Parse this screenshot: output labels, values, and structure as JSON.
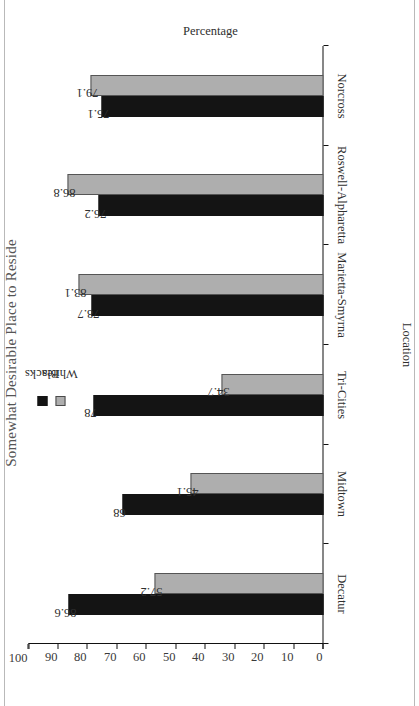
{
  "chart_data": {
    "type": "bar",
    "title": "Somewhat Desirable Place to Reside",
    "categories": [
      "Decatur",
      "Midtown",
      "Tri-Cities",
      "Marietta-Smyrna",
      "Roswell-Alpharetta",
      "Norcross"
    ],
    "series": [
      {
        "name": "Blacks",
        "color": "#141414",
        "values": [
          86.6,
          68,
          78,
          78.7,
          76.2,
          75.1
        ]
      },
      {
        "name": "Whites",
        "color": "#aeaeae",
        "values": [
          57.2,
          45.1,
          34.7,
          83.1,
          86.8,
          79.1
        ]
      }
    ],
    "xlabel": "Location",
    "ylabel": "Percentage",
    "ylim": [
      0,
      100
    ],
    "yticks": [
      0,
      10,
      20,
      30,
      40,
      50,
      60,
      70,
      80,
      90,
      100
    ],
    "ytick_labels": [
      "0",
      "10",
      "20",
      "30",
      "40",
      "50",
      "60",
      "70",
      "80",
      "90",
      "100"
    ],
    "grid": false,
    "legend_position": "top-left",
    "orientation": "rotated-90-ccw",
    "data_labels": [
      "86.6",
      "57.2",
      "68",
      "45.1",
      "78",
      "34.7",
      "78.7",
      "83.1",
      "76.2",
      "86.8",
      "75.1",
      "79.1"
    ]
  },
  "legend": {
    "items": [
      {
        "label": "Blacks",
        "color": "#141414"
      },
      {
        "label": "Whites",
        "color": "#aeaeae"
      }
    ]
  },
  "axes": {
    "value_axis_title": "Percentage",
    "category_axis_title": "Location"
  }
}
